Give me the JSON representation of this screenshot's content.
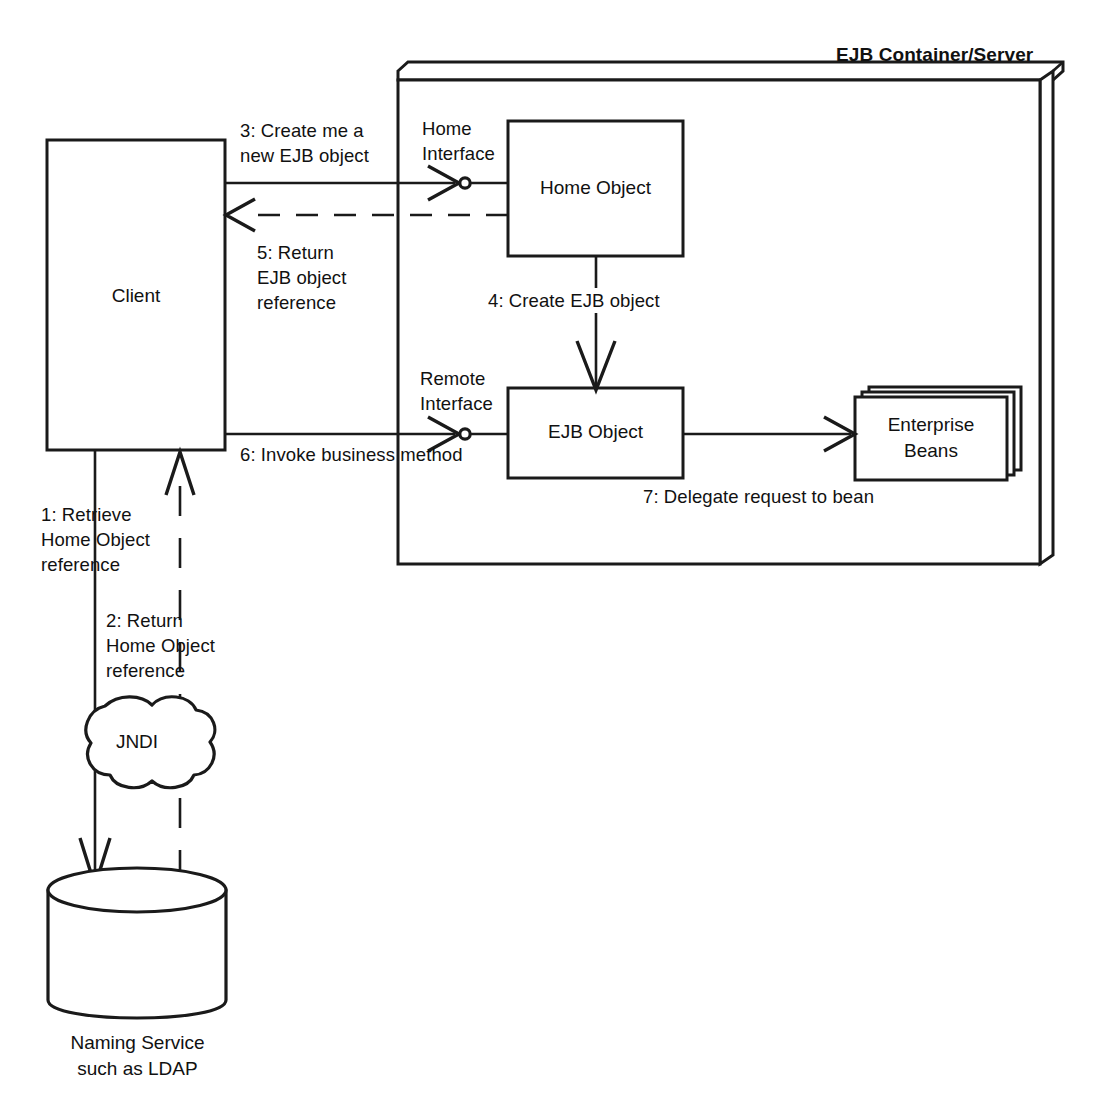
{
  "diagram": {
    "title": "EJB Container/Server",
    "type": "uml-collaboration-diagram",
    "nodes": {
      "client": "Client",
      "home_object": "Home Object",
      "ejb_object": "EJB Object",
      "enterprise_beans": "Enterprise\nBeans",
      "jndi": "JNDI",
      "naming_service": "Naming Service\nsuch as LDAP"
    },
    "interface_labels": {
      "home": "Home\nInterface",
      "remote": "Remote\nInterface"
    },
    "steps": [
      {
        "id": "1",
        "text": "1: Retrieve\nHome Object\nreference",
        "style": "solid"
      },
      {
        "id": "2",
        "text": "2: Return\nHome Object\nreference",
        "style": "dashed"
      },
      {
        "id": "3",
        "text": "3: Create me a\nnew EJB object",
        "style": "solid"
      },
      {
        "id": "4",
        "text": "4: Create EJB object",
        "style": "solid"
      },
      {
        "id": "5",
        "text": "5: Return\nEJB object\nreference",
        "style": "dashed"
      },
      {
        "id": "6",
        "text": "6: Invoke business method",
        "style": "solid"
      },
      {
        "id": "7",
        "text": "7: Delegate request to bean",
        "style": "solid"
      }
    ],
    "colors": {
      "stroke": "#1a1a1a",
      "fill": "#ffffff",
      "text": "#111111"
    }
  }
}
